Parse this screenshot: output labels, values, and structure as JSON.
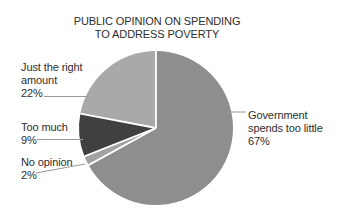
{
  "window": {
    "background_color": "#ffffff",
    "text_color": "#2e2e2e"
  },
  "chart_data": {
    "type": "pie",
    "title": "PUBLIC OPINION ON SPENDING TO ADDRESS POVERTY",
    "title_lines": [
      "PUBLIC OPINION ON SPENDING",
      "TO ADDRESS POVERTY"
    ],
    "unit": "%",
    "total": 100,
    "start_angle_deg": 0,
    "direction": "clockwise",
    "legend_position": "none",
    "separator_color": "#ffffff",
    "leader_line_color": "#999999",
    "slices": [
      {
        "label": "Government spends too little",
        "label_lines": [
          "Government",
          "spends too little"
        ],
        "value": 67,
        "value_label": "67%",
        "color": "#8e8e8e"
      },
      {
        "label": "No opinion",
        "label_lines": [
          "No opinion"
        ],
        "value": 2,
        "value_label": "2%",
        "color": "#a2a2a2"
      },
      {
        "label": "Too much",
        "label_lines": [
          "Too much"
        ],
        "value": 9,
        "value_label": "9%",
        "color": "#404040"
      },
      {
        "label": "Just the right amount",
        "label_lines": [
          "Just the right",
          "amount"
        ],
        "value": 22,
        "value_label": "22%",
        "color": "#a9a9a9"
      }
    ]
  }
}
